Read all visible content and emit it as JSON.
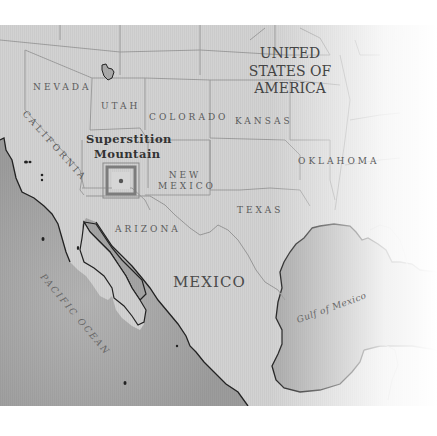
{
  "map": {
    "countries": {
      "usa": [
        "UNITED",
        "STATES OF",
        "AMERICA"
      ],
      "mexico": "MEXICO"
    },
    "states": {
      "nevada": "NEVADA",
      "utah": "UTAH",
      "colorado": "COLORADO",
      "kansas": "KANSAS",
      "california": "CALIFORNIA",
      "new_mexico": [
        "NEW",
        "MEXICO"
      ],
      "oklahoma": "OKLAHOMA",
      "arizona": "ARIZONA",
      "texas": "TEXAS"
    },
    "poi": {
      "label_line1": "Superstition",
      "label_line2": "Mountain",
      "marker_color": "#888888"
    },
    "water": {
      "pacific": "PACIFIC OCEAN",
      "gulf": "Gulf of Mexico"
    },
    "colors": {
      "land": "#d4d4d4",
      "sea": "#a8a8a8",
      "border": "#9a9a9a",
      "coast": "#222222"
    }
  }
}
